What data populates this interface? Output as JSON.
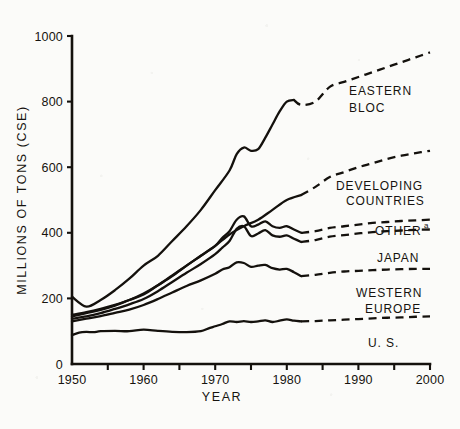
{
  "chart_data": {
    "type": "line",
    "title": "",
    "xlabel": "YEAR",
    "ylabel": "MILLIONS OF TONS (CSE)",
    "xlim": [
      1950,
      2000
    ],
    "ylim": [
      0,
      1000
    ],
    "x_ticks": [
      1950,
      1955,
      1960,
      1965,
      1970,
      1975,
      1980,
      1985,
      1990,
      1995,
      2000
    ],
    "x_tick_labels": [
      "1950",
      "",
      "1960",
      "",
      "1970",
      "",
      "1980",
      "",
      "1990",
      "",
      "2000"
    ],
    "y_ticks": [
      0,
      200,
      400,
      600,
      800,
      1000
    ],
    "y_tick_labels": [
      "0",
      "200",
      "400",
      "600",
      "800",
      "1000"
    ],
    "grid": false,
    "legend_position": "inline-right",
    "historical_end_year": 1982,
    "line_style_note": "solid = historical, dashed = projection",
    "footnote_marker": "a",
    "series": [
      {
        "name": "EASTERN BLOC",
        "label_x": 2000,
        "x": [
          1950,
          1952,
          1954,
          1956,
          1958,
          1960,
          1962,
          1964,
          1966,
          1968,
          1970,
          1972,
          1973,
          1974,
          1975,
          1976,
          1977,
          1978,
          1979,
          1980,
          1981,
          1982,
          1984,
          1986,
          1988,
          1990,
          1992,
          1994,
          1996,
          1998,
          2000
        ],
        "y": [
          205,
          175,
          195,
          225,
          260,
          300,
          330,
          375,
          420,
          470,
          530,
          590,
          640,
          660,
          650,
          655,
          690,
          730,
          770,
          800,
          805,
          790,
          800,
          845,
          860,
          875,
          890,
          905,
          920,
          935,
          950
        ],
        "historical_x_end": 1981,
        "projected_y_end": 950
      },
      {
        "name": "DEVELOPING COUNTRIES",
        "label_x": 2000,
        "x": [
          1950,
          1952,
          1954,
          1956,
          1958,
          1960,
          1962,
          1964,
          1966,
          1968,
          1970,
          1972,
          1974,
          1976,
          1978,
          1980,
          1982,
          1984,
          1986,
          1988,
          1990,
          1992,
          1994,
          1996,
          1998,
          2000
        ],
        "y": [
          150,
          158,
          168,
          180,
          195,
          215,
          240,
          270,
          300,
          330,
          360,
          395,
          420,
          440,
          470,
          500,
          515,
          540,
          570,
          585,
          600,
          612,
          625,
          635,
          643,
          650
        ],
        "historical_x_end": 1982,
        "projected_y_end": 650
      },
      {
        "name": "OTHER",
        "superscript": "a",
        "label_x": 2000,
        "x": [
          1950,
          1952,
          1954,
          1956,
          1958,
          1960,
          1962,
          1964,
          1966,
          1968,
          1970,
          1971,
          1972,
          1973,
          1974,
          1975,
          1976,
          1977,
          1978,
          1979,
          1980,
          1981,
          1982,
          1984,
          1986,
          1988,
          1990,
          1992,
          1994,
          1996,
          1998,
          2000
        ],
        "y": [
          145,
          155,
          165,
          178,
          195,
          212,
          240,
          268,
          300,
          330,
          360,
          385,
          405,
          440,
          450,
          420,
          425,
          435,
          420,
          415,
          420,
          410,
          400,
          405,
          415,
          420,
          425,
          430,
          433,
          436,
          438,
          440
        ],
        "historical_x_end": 1982,
        "projected_y_end": 440
      },
      {
        "name": "JAPAN",
        "label_x": 2000,
        "x": [
          1950,
          1952,
          1954,
          1956,
          1958,
          1960,
          1962,
          1964,
          1966,
          1968,
          1970,
          1971,
          1972,
          1973,
          1974,
          1975,
          1976,
          1977,
          1978,
          1979,
          1980,
          1981,
          1982,
          1984,
          1986,
          1988,
          1990,
          1992,
          1994,
          1996,
          1998,
          2000
        ],
        "y": [
          138,
          145,
          155,
          168,
          182,
          198,
          222,
          250,
          278,
          305,
          335,
          355,
          375,
          412,
          420,
          390,
          398,
          408,
          392,
          388,
          392,
          382,
          372,
          378,
          388,
          393,
          398,
          402,
          405,
          407,
          409,
          410
        ],
        "historical_x_end": 1982,
        "projected_y_end": 410
      },
      {
        "name": "WESTERN EUROPE",
        "label_x": 2000,
        "x": [
          1950,
          1952,
          1954,
          1956,
          1958,
          1960,
          1962,
          1964,
          1966,
          1968,
          1970,
          1971,
          1972,
          1973,
          1974,
          1975,
          1976,
          1977,
          1978,
          1979,
          1980,
          1981,
          1982,
          1984,
          1986,
          1988,
          1990,
          1992,
          1994,
          1996,
          1998,
          2000
        ],
        "y": [
          130,
          138,
          146,
          156,
          166,
          180,
          198,
          218,
          238,
          255,
          275,
          288,
          295,
          310,
          308,
          296,
          300,
          302,
          292,
          288,
          290,
          280,
          268,
          272,
          278,
          282,
          284,
          286,
          288,
          289,
          290,
          290
        ],
        "historical_x_end": 1982,
        "projected_y_end": 290
      },
      {
        "name": "U.S.",
        "display_name": "U. S.",
        "label_x": 1993,
        "x": [
          1950,
          1951,
          1952,
          1953,
          1954,
          1956,
          1958,
          1960,
          1962,
          1964,
          1966,
          1968,
          1969,
          1970,
          1971,
          1972,
          1973,
          1974,
          1975,
          1976,
          1977,
          1978,
          1979,
          1980,
          1981,
          1982,
          1984,
          1986,
          1988,
          1990,
          1992,
          1994,
          1996,
          1998,
          2000
        ],
        "y": [
          88,
          96,
          98,
          97,
          100,
          101,
          100,
          105,
          101,
          98,
          97,
          100,
          108,
          115,
          122,
          130,
          128,
          131,
          128,
          130,
          133,
          128,
          132,
          136,
          132,
          130,
          131,
          133,
          135,
          137,
          139,
          141,
          142,
          144,
          145
        ],
        "historical_x_end": 1982,
        "projected_y_end": 145
      }
    ]
  },
  "labels": {
    "eastern_bloc_line1": "EASTERN",
    "eastern_bloc_line2": "BLOC",
    "developing_line1": "DEVELOPING",
    "developing_line2": "COUNTRIES",
    "other": "OTHER",
    "other_sup": "a",
    "japan": "JAPAN",
    "western_europe_line1": "WESTERN",
    "western_europe_line2": "EUROPE",
    "us": "U. S.",
    "x_axis_title": "YEAR",
    "y_axis_title": "MILLIONS OF TONS (CSE)",
    "ytick_0": "0",
    "ytick_200": "200",
    "ytick_400": "400",
    "ytick_600": "600",
    "ytick_800": "800",
    "ytick_1000": "1000",
    "xtick_1950": "1950",
    "xtick_1960": "1960",
    "xtick_1970": "1970",
    "xtick_1980": "1980",
    "xtick_1990": "1990",
    "xtick_2000": "2000"
  },
  "colors": {
    "ink": "#14110d",
    "paper": "#fbfbf9"
  }
}
